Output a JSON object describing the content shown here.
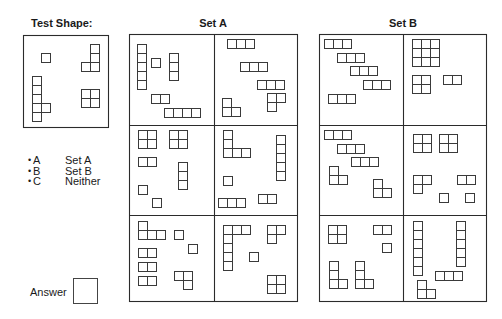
{
  "cell_size": 9,
  "colors": {
    "line": "#2b2b2b",
    "cell": "#3a3a3a",
    "background": "#ffffff"
  },
  "shape_library": {
    "S1": [
      [
        0,
        0
      ]
    ],
    "H2": [
      [
        0,
        0
      ],
      [
        1,
        0
      ]
    ],
    "H3": [
      [
        0,
        0
      ],
      [
        1,
        0
      ],
      [
        2,
        0
      ]
    ],
    "H4": [
      [
        0,
        0
      ],
      [
        1,
        0
      ],
      [
        2,
        0
      ],
      [
        3,
        0
      ]
    ],
    "V3": [
      [
        0,
        0
      ],
      [
        0,
        1
      ],
      [
        0,
        2
      ]
    ],
    "V5": [
      [
        0,
        0
      ],
      [
        0,
        1
      ],
      [
        0,
        2
      ],
      [
        0,
        3
      ],
      [
        0,
        4
      ]
    ],
    "V6": [
      [
        0,
        0
      ],
      [
        0,
        1
      ],
      [
        0,
        2
      ],
      [
        0,
        3
      ],
      [
        0,
        4
      ],
      [
        0,
        5
      ]
    ],
    "Q2": [
      [
        0,
        0
      ],
      [
        1,
        0
      ],
      [
        0,
        1
      ],
      [
        1,
        1
      ]
    ],
    "Q3": [
      [
        0,
        0
      ],
      [
        1,
        0
      ],
      [
        2,
        0
      ],
      [
        0,
        1
      ],
      [
        1,
        1
      ],
      [
        2,
        1
      ],
      [
        0,
        2
      ],
      [
        1,
        2
      ],
      [
        2,
        2
      ]
    ],
    "L3_top2_bottomleft": [
      [
        0,
        0
      ],
      [
        1,
        0
      ],
      [
        0,
        1
      ]
    ],
    "L3_topleft_bottom2": [
      [
        0,
        0
      ],
      [
        0,
        1
      ],
      [
        1,
        1
      ]
    ],
    "L3_top2_bottomright": [
      [
        0,
        0
      ],
      [
        1,
        0
      ],
      [
        1,
        1
      ]
    ],
    "L4_v3_footright": [
      [
        0,
        0
      ],
      [
        0,
        1
      ],
      [
        0,
        2
      ],
      [
        1,
        2
      ]
    ],
    "L4_top1_bottom3": [
      [
        0,
        0
      ],
      [
        0,
        1
      ],
      [
        1,
        1
      ],
      [
        2,
        1
      ]
    ],
    "L4_v3_footleft": [
      [
        1,
        0
      ],
      [
        1,
        1
      ],
      [
        1,
        2
      ],
      [
        0,
        2
      ]
    ],
    "L5_v3_foot2": [
      [
        0,
        0
      ],
      [
        0,
        1
      ],
      [
        0,
        2
      ],
      [
        1,
        2
      ],
      [
        2,
        2
      ]
    ],
    "L7_top3_down5": [
      [
        0,
        0
      ],
      [
        1,
        0
      ],
      [
        2,
        0
      ],
      [
        0,
        1
      ],
      [
        0,
        2
      ],
      [
        0,
        3
      ],
      [
        0,
        4
      ]
    ],
    "P6_v5_bump": [
      [
        0,
        0
      ],
      [
        0,
        1
      ],
      [
        0,
        2
      ],
      [
        0,
        3
      ],
      [
        0,
        4
      ],
      [
        1,
        3
      ]
    ]
  },
  "test_shape": {
    "title": "Test Shape:",
    "pieces": [
      {
        "shape": "S1",
        "x": 41,
        "y": 53
      },
      {
        "shape": "L4_v3_footleft",
        "x": 81,
        "y": 44
      },
      {
        "shape": "P6_v5_bump",
        "x": 32,
        "y": 76
      },
      {
        "shape": "Q2",
        "x": 81,
        "y": 89
      }
    ]
  },
  "set_a": {
    "title": "Set A",
    "panels": [
      {
        "pieces": [
          {
            "shape": "V5",
            "x": 137,
            "y": 44
          },
          {
            "shape": "S1",
            "x": 151,
            "y": 58
          },
          {
            "shape": "V3",
            "x": 169,
            "y": 53
          },
          {
            "shape": "H2",
            "x": 151,
            "y": 94
          },
          {
            "shape": "H4",
            "x": 164,
            "y": 108
          }
        ]
      },
      {
        "pieces": [
          {
            "shape": "H3",
            "x": 227,
            "y": 39
          },
          {
            "shape": "H3",
            "x": 240,
            "y": 62
          },
          {
            "shape": "H3",
            "x": 257,
            "y": 80
          },
          {
            "shape": "L3_top2_bottomleft",
            "x": 267,
            "y": 93
          },
          {
            "shape": "L3_topleft_bottom2",
            "x": 222,
            "y": 98
          }
        ]
      },
      {
        "pieces": [
          {
            "shape": "Q2",
            "x": 138,
            "y": 130
          },
          {
            "shape": "Q2",
            "x": 169,
            "y": 130
          },
          {
            "shape": "H2",
            "x": 138,
            "y": 157
          },
          {
            "shape": "V3",
            "x": 178,
            "y": 162
          },
          {
            "shape": "S1",
            "x": 138,
            "y": 185
          },
          {
            "shape": "S1",
            "x": 152,
            "y": 198
          }
        ]
      },
      {
        "pieces": [
          {
            "shape": "L5_v3_foot2",
            "x": 223,
            "y": 130
          },
          {
            "shape": "V5",
            "x": 276,
            "y": 135
          },
          {
            "shape": "S1",
            "x": 223,
            "y": 176
          },
          {
            "shape": "H3",
            "x": 218,
            "y": 198
          },
          {
            "shape": "H2",
            "x": 258,
            "y": 194
          }
        ]
      },
      {
        "pieces": [
          {
            "shape": "L4_top1_bottom3",
            "x": 138,
            "y": 221
          },
          {
            "shape": "S1",
            "x": 174,
            "y": 230
          },
          {
            "shape": "S1",
            "x": 188,
            "y": 244
          },
          {
            "shape": "H2",
            "x": 138,
            "y": 248
          },
          {
            "shape": "H2",
            "x": 138,
            "y": 262
          },
          {
            "shape": "H2",
            "x": 138,
            "y": 276
          },
          {
            "shape": "L3_top2_bottomright",
            "x": 174,
            "y": 271
          }
        ]
      },
      {
        "pieces": [
          {
            "shape": "L7_top3_down5",
            "x": 223,
            "y": 225
          },
          {
            "shape": "L3_top2_bottomleft",
            "x": 267,
            "y": 225
          },
          {
            "shape": "S1",
            "x": 249,
            "y": 252
          },
          {
            "shape": "Q2",
            "x": 267,
            "y": 275
          }
        ]
      }
    ]
  },
  "set_b": {
    "title": "Set B",
    "panels": [
      {
        "pieces": [
          {
            "shape": "H3",
            "x": 324,
            "y": 39
          },
          {
            "shape": "H3",
            "x": 337,
            "y": 53
          },
          {
            "shape": "H3",
            "x": 350,
            "y": 66
          },
          {
            "shape": "H3",
            "x": 363,
            "y": 80
          },
          {
            "shape": "H3",
            "x": 328,
            "y": 94
          }
        ]
      },
      {
        "pieces": [
          {
            "shape": "Q3",
            "x": 412,
            "y": 39
          },
          {
            "shape": "Q2",
            "x": 412,
            "y": 75
          },
          {
            "shape": "H2",
            "x": 443,
            "y": 75
          }
        ]
      },
      {
        "pieces": [
          {
            "shape": "H3",
            "x": 324,
            "y": 130
          },
          {
            "shape": "H3",
            "x": 337,
            "y": 144
          },
          {
            "shape": "H3",
            "x": 351,
            "y": 157
          },
          {
            "shape": "L3_topleft_bottom2",
            "x": 329,
            "y": 166
          },
          {
            "shape": "L3_topleft_bottom2",
            "x": 373,
            "y": 179
          }
        ]
      },
      {
        "pieces": [
          {
            "shape": "Q2",
            "x": 413,
            "y": 134
          },
          {
            "shape": "Q2",
            "x": 439,
            "y": 134
          },
          {
            "shape": "L3_top2_bottomleft",
            "x": 413,
            "y": 175
          },
          {
            "shape": "H2",
            "x": 457,
            "y": 175
          },
          {
            "shape": "S1",
            "x": 439,
            "y": 193
          },
          {
            "shape": "S1",
            "x": 465,
            "y": 193
          }
        ]
      },
      {
        "pieces": [
          {
            "shape": "Q2",
            "x": 328,
            "y": 225
          },
          {
            "shape": "H2",
            "x": 373,
            "y": 225
          },
          {
            "shape": "S1",
            "x": 382,
            "y": 243
          },
          {
            "shape": "L4_v3_footright",
            "x": 329,
            "y": 261
          },
          {
            "shape": "L4_v3_footright",
            "x": 355,
            "y": 261
          }
        ]
      },
      {
        "pieces": [
          {
            "shape": "V6",
            "x": 413,
            "y": 221
          },
          {
            "shape": "V5",
            "x": 456,
            "y": 221
          },
          {
            "shape": "H3",
            "x": 435,
            "y": 271
          },
          {
            "shape": "L3_topleft_bottom2",
            "x": 417,
            "y": 280
          }
        ]
      }
    ]
  },
  "legend": {
    "options": [
      {
        "bullet": "•",
        "letter": "A",
        "label": "Set A"
      },
      {
        "bullet": "•",
        "letter": "B",
        "label": "Set B"
      },
      {
        "bullet": "•",
        "letter": "C",
        "label": "Neither"
      }
    ]
  },
  "answer": {
    "label": "Answer",
    "value": ""
  }
}
